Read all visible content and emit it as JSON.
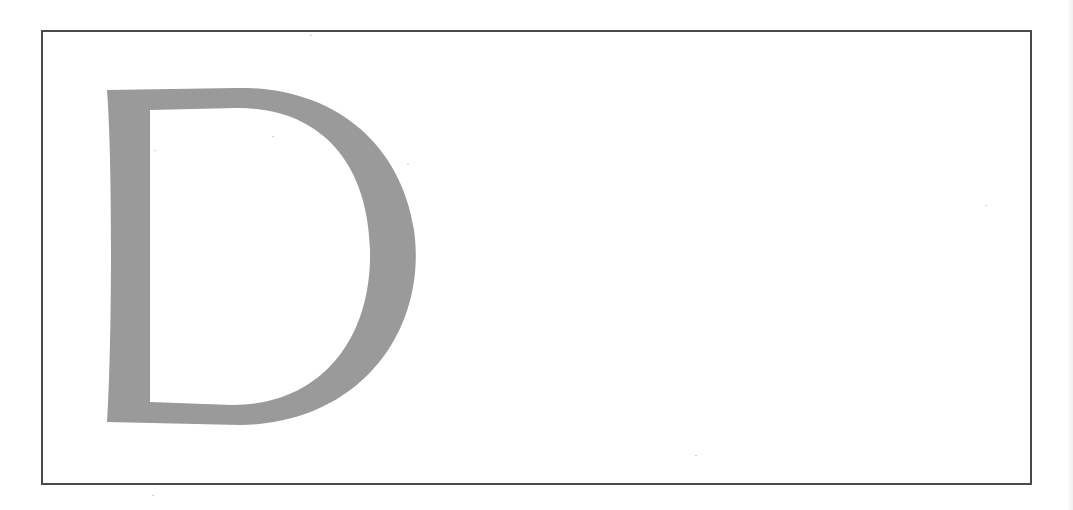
{
  "page": {
    "dropcap": {
      "letter": "D",
      "color": "#9a9a9a"
    },
    "frame": {
      "border_color": "#4a4a4a"
    }
  }
}
